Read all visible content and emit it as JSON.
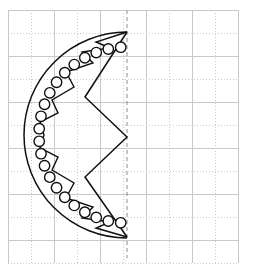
{
  "figure": {
    "background_color": "#ffffff",
    "ink_color": "#111111",
    "grid_color": "#c9c9c9",
    "axis_color": "#8d8d8d"
  },
  "canvas": {
    "width": 255,
    "height": 266
  },
  "grid": {
    "type": "square",
    "cell_size": 23,
    "origin_x": 8,
    "origin_y": 10,
    "columns": 10,
    "rows": 11,
    "line_style_alternating": "solid-dotted",
    "solid_color": "#c9c9c9",
    "dotted_color": "#c9c9c9"
  },
  "mirror_axis": {
    "name": "vertical-mirror-axis",
    "orientation": "vertical",
    "x": 127,
    "y_start": 10,
    "y_end": 258,
    "style": "dashed",
    "color": "#8d8d8d"
  },
  "chart_data": {
    "type": "scatter",
    "xlabel": "",
    "ylabel": "",
    "xlim": [
      8,
      248
    ],
    "ylim": [
      10,
      258
    ],
    "grid": true,
    "legend": "none",
    "outer_arc": {
      "name": "semicircle-outline",
      "center_x": 127,
      "center_y": 135,
      "radius": 103,
      "side": "left",
      "start_angle_deg": 90,
      "end_angle_deg": 270
    },
    "bead_circles": {
      "name": "bead-ring",
      "count": 22,
      "radius": 5.2,
      "ring_radius": 88,
      "center_x": 127,
      "center_y": 135,
      "points": [
        [
          118.5,
          47.6
        ],
        [
          105.0,
          49.8
        ],
        [
          92.2,
          54.3
        ],
        [
          80.5,
          61.0
        ],
        [
          70.2,
          69.6
        ],
        [
          61.6,
          79.9
        ],
        [
          54.9,
          91.6
        ],
        [
          50.4,
          104.4
        ],
        [
          48.1,
          117.9
        ],
        [
          48.1,
          131.6
        ],
        [
          50.4,
          145.1
        ],
        [
          54.9,
          157.9
        ],
        [
          61.6,
          169.6
        ],
        [
          70.2,
          179.9
        ],
        [
          80.5,
          188.5
        ],
        [
          92.2,
          195.2
        ],
        [
          105.0,
          199.7
        ],
        [
          118.5,
          201.9
        ],
        [
          118.5,
          213.0
        ],
        [
          104.0,
          212.0
        ],
        [
          64.0,
          186.0
        ],
        [
          57.0,
          170.0
        ]
      ]
    },
    "inner_zigzag": {
      "name": "central-chevron",
      "vertices": [
        [
          127,
          32
        ],
        [
          85,
          97
        ],
        [
          127,
          137
        ],
        [
          85,
          177
        ],
        [
          127,
          237
        ]
      ]
    },
    "petal_polyline": {
      "name": "scalloped-inner-rim",
      "vertices": [
        [
          127,
          32
        ],
        [
          96,
          42
        ],
        [
          110,
          48
        ],
        [
          82,
          52
        ],
        [
          93,
          63
        ],
        [
          66,
          72
        ],
        [
          74,
          87
        ],
        [
          52,
          100
        ],
        [
          58,
          113
        ],
        [
          40,
          122
        ],
        [
          44,
          135
        ],
        [
          40,
          148
        ],
        [
          58,
          157
        ],
        [
          52,
          170
        ],
        [
          74,
          183
        ],
        [
          66,
          198
        ],
        [
          93,
          207
        ],
        [
          82,
          218
        ],
        [
          110,
          222
        ],
        [
          96,
          228
        ],
        [
          127,
          237
        ]
      ]
    }
  },
  "a11y": {
    "figure_label": "geometric-half-rosette-diagram"
  }
}
